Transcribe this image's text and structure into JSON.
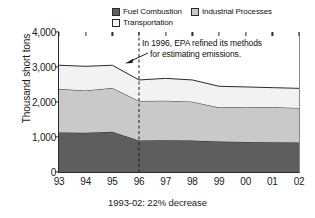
{
  "legend": {
    "items": [
      {
        "label": "Fuel Combustion",
        "color": "#5e5e5e",
        "name": "legend-fuel-combustion"
      },
      {
        "label": "Industrial Processes",
        "color": "#c9c9c9",
        "name": "legend-industrial-processes"
      },
      {
        "label": "Transportation",
        "color": "#f2f2f2",
        "name": "legend-transportation"
      }
    ]
  },
  "axes": {
    "ylabel": "Thousand short tons",
    "yticks": [
      "0",
      "1,000",
      "2,000",
      "3,000",
      "4,000"
    ],
    "ytick_values": [
      0,
      1000,
      2000,
      3000,
      4000
    ],
    "xticks": [
      "93",
      "94",
      "95",
      "96",
      "97",
      "98",
      "99",
      "00",
      "01",
      "02"
    ]
  },
  "caption": "1993-02: 22%  decrease",
  "annotation": {
    "line1": "In 1996, EPA refined its methods",
    "line2": "for estimating emissions.",
    "marker_year": "96"
  },
  "chart_data": {
    "type": "area",
    "title": "",
    "subtitle": "",
    "xlabel": "",
    "ylabel": "Thousand short tons",
    "ylim": [
      0,
      4000
    ],
    "grid": false,
    "legend_position": "top",
    "stacked": true,
    "x": [
      "93",
      "94",
      "95",
      "96",
      "97",
      "98",
      "99",
      "00",
      "01",
      "02"
    ],
    "categories": [
      "93",
      "94",
      "95",
      "96",
      "97",
      "98",
      "99",
      "00",
      "01",
      "02"
    ],
    "series": [
      {
        "name": "Fuel Combustion",
        "color": "#5e5e5e",
        "values": [
          1130,
          1120,
          1150,
          900,
          905,
          900,
          870,
          860,
          850,
          840
        ]
      },
      {
        "name": "Industrial Processes",
        "color": "#c9c9c9",
        "values": [
          1240,
          1210,
          1250,
          1130,
          1130,
          1110,
          970,
          1000,
          1000,
          990
        ]
      },
      {
        "name": "Transportation",
        "color": "#f2f2f2",
        "values": [
          680,
          690,
          650,
          600,
          640,
          620,
          610,
          570,
          560,
          560
        ]
      }
    ],
    "totals": [
      3050,
      3020,
      3050,
      2630,
      2675,
      2630,
      2450,
      2430,
      2410,
      2390
    ],
    "annotations": [
      {
        "text": "In 1996, EPA refined its methods for estimating emissions.",
        "at_x": "96"
      },
      {
        "text": "1993-02: 22%  decrease",
        "position": "below-axis"
      }
    ]
  }
}
